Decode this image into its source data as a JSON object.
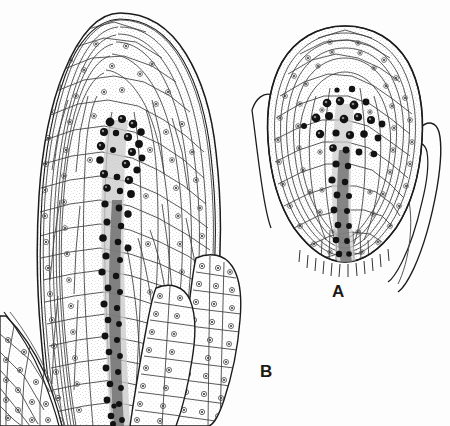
{
  "figure": {
    "kind": "scientific-line-drawing",
    "technique": "ink stipple and line drawing, autoradiograph-style labelled nuclei",
    "background_color": "#fdfdfd",
    "ink_color": "#1c1c1c",
    "cell_wall_color": "#3a3a3a",
    "cytoplasm_stipple_color": "#9a9a9a",
    "stained_nucleus_color": "#111111",
    "width": 450,
    "height": 426
  },
  "panels": [
    {
      "id": "A",
      "label": "A",
      "label_x": 332,
      "label_y": 283,
      "description": "Smaller dome-shaped shoot apex with flanking leaf primordia on both sides",
      "center_x": 345,
      "center_y": 155,
      "apex_width": 150,
      "apex_height": 240,
      "stained_cell_count": 34,
      "has_left_primordium": true,
      "has_right_primordium": true
    },
    {
      "id": "B",
      "label": "B",
      "label_x": 260,
      "label_y": 363,
      "description": "Larger elongated shoot apex with rib meristem core and two leaf primordia at lower right plus primordium tissue at lower left",
      "center_x": 120,
      "center_y": 200,
      "apex_width": 200,
      "apex_height": 400,
      "stained_cell_count": 72,
      "has_left_primordium": true,
      "has_right_primordium": true
    }
  ],
  "regions": {
    "tunica": "outer one to two cell layers of the apical dome",
    "corpus": "inner body of the apical dome",
    "rib_meristem": "central file of darkly stained dividing cells",
    "leaf_primordium": "lateral outgrowth of small isodiametric cells"
  },
  "legend": {
    "dark_cells_meaning": "heavily labelled / mitotically active nuclei",
    "stipple_meaning": "cytoplasm density"
  }
}
